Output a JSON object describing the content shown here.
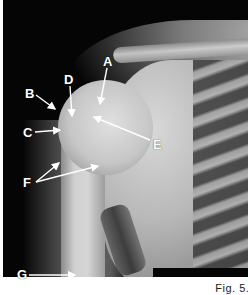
{
  "figure": {
    "caption": "Fig. 5.3",
    "image_description": "Shoulder radiograph (AP view)",
    "labels": [
      {
        "id": "A",
        "text": "A",
        "x": 103,
        "y": 55
      },
      {
        "id": "B",
        "text": "B",
        "x": 25,
        "y": 87
      },
      {
        "id": "C",
        "text": "C",
        "x": 23,
        "y": 126
      },
      {
        "id": "D",
        "text": "D",
        "x": 64,
        "y": 73
      },
      {
        "id": "E",
        "text": "E",
        "x": 153,
        "y": 138
      },
      {
        "id": "F",
        "text": "F",
        "x": 23,
        "y": 179
      },
      {
        "id": "G",
        "text": "G",
        "x": 17,
        "y": 268
      }
    ]
  }
}
